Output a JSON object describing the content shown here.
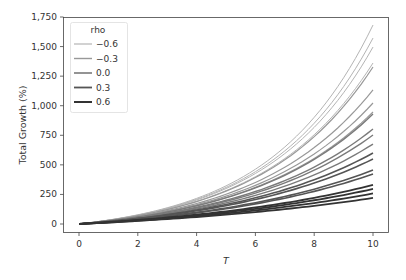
{
  "chart_data": {
    "type": "line",
    "title": "",
    "xlabel": "T",
    "ylabel": "Total Growth (%)",
    "xlim": [
      -0.6,
      10.8
    ],
    "ylim": [
      -80,
      1750
    ],
    "x_ticks": [
      0,
      2,
      4,
      6,
      8,
      10
    ],
    "x_tick_labels": [
      "0",
      "2",
      "4",
      "6",
      "8",
      "10"
    ],
    "y_ticks": [
      0,
      250,
      500,
      750,
      1000,
      1250,
      1500,
      1750
    ],
    "y_tick_labels": [
      "0",
      "250",
      "500",
      "750",
      "1,000",
      "1,250",
      "1,500",
      "1,750"
    ],
    "grid": false,
    "legend": {
      "title": "rho",
      "position": "upper left",
      "entries": [
        {
          "label": "−0.6",
          "color": "#b4b4b4",
          "width": 1.0
        },
        {
          "label": "−0.3",
          "color": "#989898",
          "width": 1.2
        },
        {
          "label": "0.0",
          "color": "#7a7a7a",
          "width": 1.4
        },
        {
          "label": "0.3",
          "color": "#555555",
          "width": 1.6
        },
        {
          "label": "0.6",
          "color": "#333333",
          "width": 1.8
        }
      ]
    },
    "x": [
      0,
      1,
      2,
      3,
      4,
      5,
      6,
      7,
      8,
      9,
      10
    ],
    "series": [
      {
        "name": "rho=-0.6 #1",
        "rho": "-0.6",
        "final": 1682
      },
      {
        "name": "rho=-0.6 #2",
        "rho": "-0.6",
        "final": 1572
      },
      {
        "name": "rho=-0.6 #3",
        "rho": "-0.6",
        "final": 1496
      },
      {
        "name": "rho=-0.6 #4",
        "rho": "-0.6",
        "final": 1361
      },
      {
        "name": "rho=-0.3 #1",
        "rho": "-0.3",
        "final": 1327
      },
      {
        "name": "rho=-0.3 #2",
        "rho": "-0.3",
        "final": 1133
      },
      {
        "name": "rho=-0.3 #3",
        "rho": "-0.3",
        "final": 1023
      },
      {
        "name": "rho=-0.3 #4",
        "rho": "-0.3",
        "final": 947
      },
      {
        "name": "rho=0.0 #1",
        "rho": "0.0",
        "final": 930
      },
      {
        "name": "rho=0.0 #2",
        "rho": "0.0",
        "final": 803
      },
      {
        "name": "rho=0.0 #3",
        "rho": "0.0",
        "final": 752
      },
      {
        "name": "rho=0.0 #4",
        "rho": "0.0",
        "final": 676
      },
      {
        "name": "rho=0.3 #1",
        "rho": "0.3",
        "final": 600
      },
      {
        "name": "rho=0.3 #2",
        "rho": "0.3",
        "final": 549
      },
      {
        "name": "rho=0.3 #3",
        "rho": "0.3",
        "final": 456
      },
      {
        "name": "rho=0.3 #4",
        "rho": "0.3",
        "final": 423
      },
      {
        "name": "rho=0.6 #1",
        "rho": "0.6",
        "final": 330
      },
      {
        "name": "rho=0.6 #2",
        "rho": "0.6",
        "final": 296
      },
      {
        "name": "rho=0.6 #3",
        "rho": "0.6",
        "final": 258
      },
      {
        "name": "rho=0.6 #4",
        "rho": "0.6",
        "final": 220
      }
    ],
    "curve_model": "value(T) = 100 * ((1 + final/100)^(T/10) - 1)"
  }
}
